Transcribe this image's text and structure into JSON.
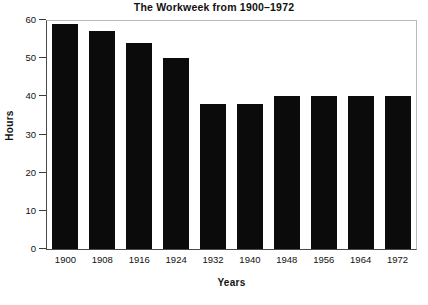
{
  "chart_data": {
    "type": "bar",
    "title": "The Workweek from 1900–1972",
    "xlabel": "Years",
    "ylabel": "Hours",
    "categories": [
      "1900",
      "1908",
      "1916",
      "1924",
      "1932",
      "1940",
      "1948",
      "1956",
      "1964",
      "1972"
    ],
    "values": [
      59,
      57,
      54,
      50,
      38,
      38,
      40,
      40,
      40,
      40
    ],
    "ylim": [
      0,
      60
    ],
    "yticks": [
      0,
      10,
      20,
      30,
      40,
      50,
      60
    ],
    "ytick_labels": [
      "0",
      "10",
      "20",
      "30",
      "40",
      "50",
      "60"
    ],
    "grid": false,
    "legend": null,
    "bar_color": "#0b0b0b",
    "frame_color": "#b9b9b9",
    "axis_color": "#4a4a4a"
  }
}
